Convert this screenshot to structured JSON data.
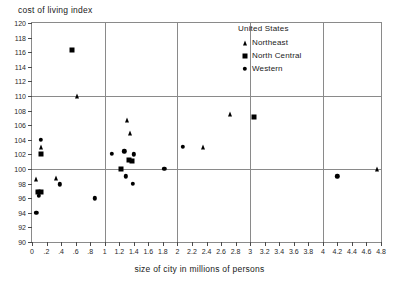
{
  "chart_data": {
    "type": "scatter",
    "title": "",
    "ylabel": "cost of living index",
    "xlabel": "size of city in millions of persons",
    "xlim": [
      0,
      4.8
    ],
    "ylim": [
      90,
      120
    ],
    "x_ticks": [
      "0",
      ".2",
      ".4",
      ".6",
      ".8",
      "1",
      "1.2",
      "1.4",
      "1.6",
      "1.8",
      "2",
      "2.2",
      "2.4",
      "2.6",
      "2.8",
      "3",
      "3.2",
      "3.4",
      "3.6",
      "3.8",
      "4",
      "4.2",
      "4.4",
      "4.6",
      "4.8"
    ],
    "x_tick_values": [
      0,
      0.2,
      0.4,
      0.6,
      0.8,
      1.0,
      1.2,
      1.4,
      1.6,
      1.8,
      2.0,
      2.2,
      2.4,
      2.6,
      2.8,
      3.0,
      3.2,
      3.4,
      3.6,
      3.8,
      4.0,
      4.2,
      4.4,
      4.6,
      4.8
    ],
    "y_ticks": [
      "90",
      "92",
      "94",
      "96",
      "98",
      "100",
      "102",
      "104",
      "106",
      "108",
      "110",
      "112",
      "114",
      "116",
      "118",
      "120"
    ],
    "y_tick_values": [
      90,
      92,
      94,
      96,
      98,
      100,
      102,
      104,
      106,
      108,
      110,
      112,
      114,
      116,
      118,
      120
    ],
    "grid": true,
    "grid_x_values": [
      1,
      2,
      3,
      4
    ],
    "grid_y_values": [
      100,
      110
    ],
    "legend_position": "top-right",
    "legend_title": "United States",
    "series": [
      {
        "name": "Northeast",
        "marker": "triangle",
        "points": [
          [
            0.06,
            98.6
          ],
          [
            0.12,
            103.0
          ],
          [
            0.33,
            98.8
          ],
          [
            0.62,
            110.0
          ],
          [
            1.3,
            106.7
          ],
          [
            1.35,
            105.0
          ],
          [
            2.35,
            103.0
          ],
          [
            2.72,
            107.6
          ],
          [
            4.75,
            100.0
          ]
        ]
      },
      {
        "name": "North Central",
        "marker": "square",
        "points": [
          [
            0.08,
            96.8
          ],
          [
            0.12,
            96.9
          ],
          [
            0.13,
            102.0
          ],
          [
            0.55,
            116.3
          ],
          [
            1.23,
            100.0
          ],
          [
            1.33,
            101.3
          ],
          [
            1.38,
            101.1
          ],
          [
            3.05,
            107.1
          ]
        ]
      },
      {
        "name": "Western",
        "marker": "circle",
        "points": [
          [
            0.06,
            94.0
          ],
          [
            0.08,
            96.9
          ],
          [
            0.09,
            96.3
          ],
          [
            0.12,
            104.0
          ],
          [
            0.38,
            97.9
          ],
          [
            0.86,
            96.0
          ],
          [
            1.1,
            102.1
          ],
          [
            1.27,
            102.4
          ],
          [
            1.29,
            99.0
          ],
          [
            1.39,
            98.0
          ],
          [
            1.4,
            102.0
          ],
          [
            1.82,
            100.0
          ],
          [
            2.07,
            103.0
          ],
          [
            4.2,
            99.0
          ]
        ]
      }
    ]
  }
}
